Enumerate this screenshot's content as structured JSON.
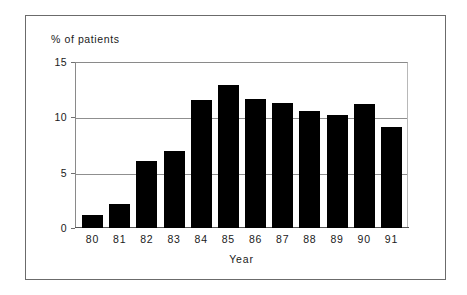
{
  "chart_data": {
    "type": "bar",
    "title": "",
    "xlabel": "Year",
    "ylabel": "% of patients",
    "categories": [
      "80",
      "81",
      "82",
      "83",
      "84",
      "85",
      "86",
      "87",
      "88",
      "89",
      "90",
      "91"
    ],
    "values": [
      1.2,
      2.2,
      6.1,
      7.0,
      11.6,
      12.9,
      11.7,
      11.3,
      10.6,
      10.2,
      11.2,
      9.1
    ],
    "ylim": [
      0,
      15
    ],
    "yticks": [
      0,
      5,
      10,
      15
    ],
    "ytick_labels": [
      "0",
      "5",
      "10",
      "15"
    ],
    "grid": "horizontal",
    "legend": "none",
    "bar_color": "#000000",
    "grid_color": "#8f8f8f",
    "frame_color": "#6b6b6b",
    "background": "#ffffff"
  },
  "figure": {
    "y_axis_caption": "% of patients",
    "x_axis_title": "Year"
  }
}
